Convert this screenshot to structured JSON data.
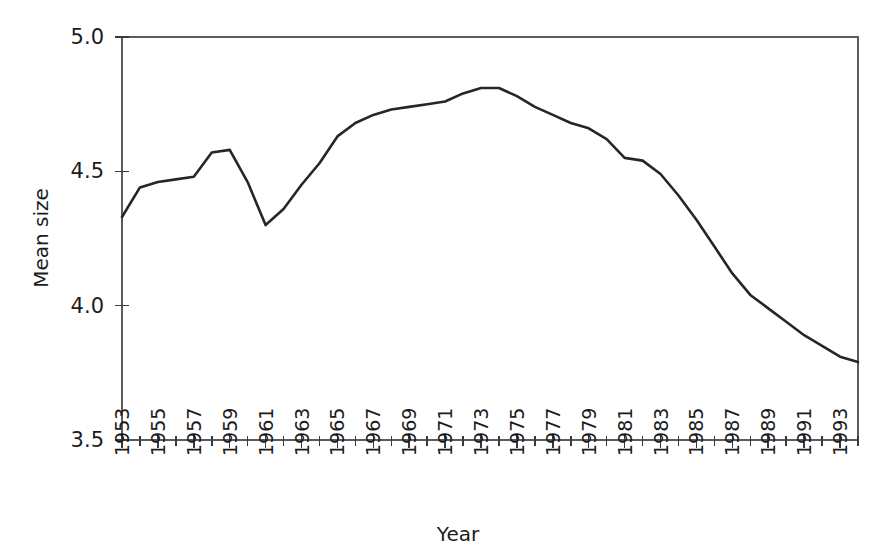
{
  "chart_data": {
    "type": "line",
    "title": "",
    "subtitle": "",
    "xlabel": "Year",
    "ylabel": "Mean size",
    "xlim": [
      1953,
      1994
    ],
    "ylim": [
      3.5,
      5.0
    ],
    "grid": false,
    "legend": null,
    "annotations": [],
    "y_ticks": [
      "3.5",
      "4.0",
      "4.5",
      "5.0"
    ],
    "y_tick_values": [
      3.5,
      4.0,
      4.5,
      5.0
    ],
    "x_tick_labels": [
      "1953",
      "1955",
      "1957",
      "1959",
      "1961",
      "1963",
      "1965",
      "1967",
      "1969",
      "1971",
      "1973",
      "1975",
      "1977",
      "1979",
      "1981",
      "1983",
      "1985",
      "1987",
      "1989",
      "1991",
      "1993"
    ],
    "x_minor_tick_interval": 1,
    "x_major_tick_interval": 2,
    "series": [
      {
        "name": "Mean size",
        "color": "#262626",
        "x": [
          1953,
          1954,
          1955,
          1956,
          1957,
          1958,
          1959,
          1960,
          1961,
          1962,
          1963,
          1964,
          1965,
          1966,
          1967,
          1968,
          1969,
          1970,
          1971,
          1972,
          1973,
          1974,
          1975,
          1976,
          1977,
          1978,
          1979,
          1980,
          1981,
          1982,
          1983,
          1984,
          1985,
          1986,
          1987,
          1988,
          1989,
          1990,
          1991,
          1992,
          1993,
          1994
        ],
        "values": [
          4.33,
          4.44,
          4.46,
          4.47,
          4.48,
          4.57,
          4.58,
          4.46,
          4.3,
          4.36,
          4.45,
          4.53,
          4.63,
          4.68,
          4.71,
          4.73,
          4.74,
          4.75,
          4.76,
          4.79,
          4.81,
          4.81,
          4.78,
          4.74,
          4.71,
          4.68,
          4.66,
          4.62,
          4.55,
          4.54,
          4.49,
          4.41,
          4.32,
          4.22,
          4.12,
          4.04,
          3.99,
          3.94,
          3.89,
          3.85,
          3.81,
          3.79
        ]
      }
    ]
  },
  "axes": {
    "y_title": "Mean size",
    "x_title": "Year"
  }
}
